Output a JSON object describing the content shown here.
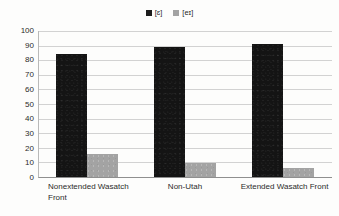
{
  "chart_data": {
    "type": "bar",
    "title": "",
    "subtitle": "",
    "xlabel": "",
    "ylabel": "",
    "ylim": [
      0,
      100
    ],
    "ytick_step": 10,
    "yticks": [
      100,
      90,
      80,
      70,
      60,
      50,
      40,
      30,
      20,
      10,
      0
    ],
    "grid": true,
    "legend_position": "top-center",
    "categories": [
      "Nonextended Wasatch Front",
      "Non-Utah",
      "Extended Wasatch Front"
    ],
    "series": [
      {
        "name": "[ɛ]",
        "color": "#141414",
        "values": [
          84,
          89,
          91
        ]
      },
      {
        "name": "[eɪ]",
        "color": "#a3a3a3",
        "values": [
          16,
          9.5,
          6.5
        ]
      }
    ]
  },
  "legend": {
    "entries": [
      {
        "label": "[ɛ]",
        "swatch": "dark-swatch-icon"
      },
      {
        "label": "[eɪ]",
        "swatch": "gray-swatch-icon"
      }
    ]
  },
  "axes": {
    "y": {
      "labels": [
        "100",
        "90",
        "80",
        "70",
        "60",
        "50",
        "40",
        "30",
        "20",
        "10",
        "0"
      ]
    },
    "x": {
      "labels": [
        "Nonextended Wasatch Front",
        "Non-Utah",
        "Extended Wasatch Front"
      ]
    }
  },
  "colors": {
    "series_dark": "#141414",
    "series_gray": "#a3a3a3",
    "gridline": "#d2d2d2",
    "axis": "#8f8f8f",
    "background": "#fdfdfc",
    "text": "#2b2b2b"
  }
}
